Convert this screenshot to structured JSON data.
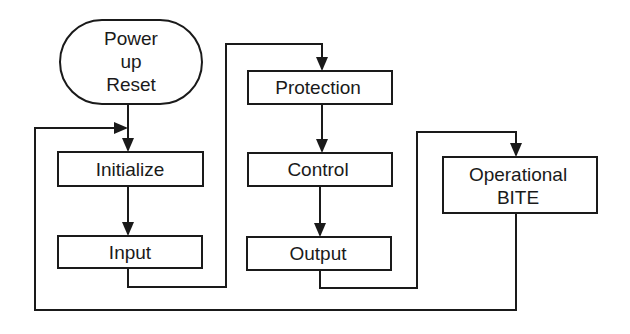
{
  "diagram": {
    "type": "flowchart",
    "colors": {
      "stroke": "#1a1a1a",
      "background": "#ffffff",
      "fill": "#ffffff"
    },
    "nodes": [
      {
        "id": "power_up_reset",
        "shape": "terminator",
        "lines": [
          "Power",
          "up",
          "Reset"
        ]
      },
      {
        "id": "initialize",
        "shape": "process",
        "lines": [
          "Initialize"
        ]
      },
      {
        "id": "input",
        "shape": "process",
        "lines": [
          "Input"
        ]
      },
      {
        "id": "protection",
        "shape": "process",
        "lines": [
          "Protection"
        ]
      },
      {
        "id": "control",
        "shape": "process",
        "lines": [
          "Control"
        ]
      },
      {
        "id": "output",
        "shape": "process",
        "lines": [
          "Output"
        ]
      },
      {
        "id": "operational_bite",
        "shape": "process",
        "lines": [
          "Operational",
          "BITE"
        ]
      }
    ],
    "edges": [
      {
        "from": "power_up_reset",
        "to": "initialize"
      },
      {
        "from": "initialize",
        "to": "input"
      },
      {
        "from": "input",
        "to": "protection"
      },
      {
        "from": "protection",
        "to": "control"
      },
      {
        "from": "control",
        "to": "output"
      },
      {
        "from": "output",
        "to": "operational_bite"
      },
      {
        "from": "operational_bite",
        "to": "initialize",
        "note": "loop back"
      }
    ]
  }
}
